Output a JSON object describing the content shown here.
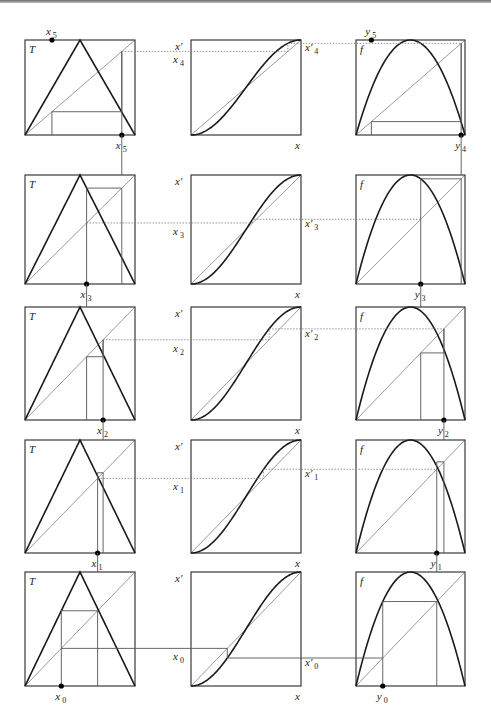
{
  "figure": {
    "colors": {
      "ink": "#1a1a1a",
      "thin": "#555555",
      "dotted": "#777777",
      "box": "#3a3a3a"
    },
    "columns": {
      "left": {
        "map_label": "T",
        "x0": 25,
        "width": 110
      },
      "middle": {
        "map_label": "x'",
        "axis_label": "x",
        "x0": 191,
        "width": 110
      },
      "right": {
        "map_label": "f",
        "x0": 356,
        "width": 109
      }
    },
    "rows": [
      {
        "n": 5,
        "top": 40,
        "height": 95,
        "x_label": "x",
        "x_index": "4",
        "xp_index": "4",
        "dot_label": "x",
        "dot_index": "5",
        "y_dot_index": "5",
        "y_label_index": "4"
      },
      {
        "n": 4,
        "top": 175,
        "height": 109,
        "x_index": "3",
        "xp_index": "3",
        "dot_index": "3",
        "y_label_index": "3"
      },
      {
        "n": 3,
        "top": 307,
        "height": 113,
        "x_index": "2",
        "xp_index": "2",
        "dot_index": "2",
        "y_label_index": "2"
      },
      {
        "n": 2,
        "top": 440,
        "height": 113,
        "x_index": "1",
        "xp_index": "1",
        "dot_index": "1",
        "y_label_index": "1"
      },
      {
        "n": 1,
        "top": 572,
        "height": 114,
        "x_index": "0",
        "xp_index": "0",
        "dot_index": "0",
        "y_label_index": "0"
      }
    ],
    "orbit_x": [
      0.33,
      0.66,
      0.71,
      0.56,
      0.88,
      0.245
    ],
    "labels": {
      "T": "T",
      "f": "f",
      "xprime": "x'",
      "x": "x",
      "y": "y",
      "x5": "5",
      "y5": "5"
    }
  }
}
